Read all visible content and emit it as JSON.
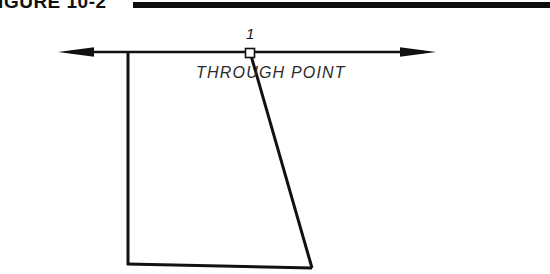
{
  "figure": {
    "caption_text": "FIGURE 10-2",
    "caption_rule_color": "#0d0d0d"
  },
  "diagram": {
    "line_color": "#111111",
    "background_color": "#ffffff",
    "point_number_label": "1",
    "through_point_label": "THROUGH  POINT",
    "elements": {
      "horizontal_axis": {
        "name": "horizontal-construction-line",
        "x1": 58,
        "y1": 52,
        "x2": 436,
        "y2": 52,
        "left_arrowhead": true,
        "right_arrowhead": true
      },
      "vertical_line": {
        "name": "vertical-construction-line",
        "x1": 128,
        "y1": 52,
        "x2": 128,
        "y2": 264
      },
      "bottom_line": {
        "name": "bottom-base-line",
        "x1": 128,
        "y1": 264,
        "x2": 312,
        "y2": 268
      },
      "slanted_line": {
        "name": "slanted-through-line",
        "x1": 250,
        "y1": 53,
        "x2": 312,
        "y2": 268
      },
      "point_marker": {
        "name": "through-point-square-marker",
        "cx": 250,
        "cy": 53,
        "size": 9
      }
    }
  }
}
